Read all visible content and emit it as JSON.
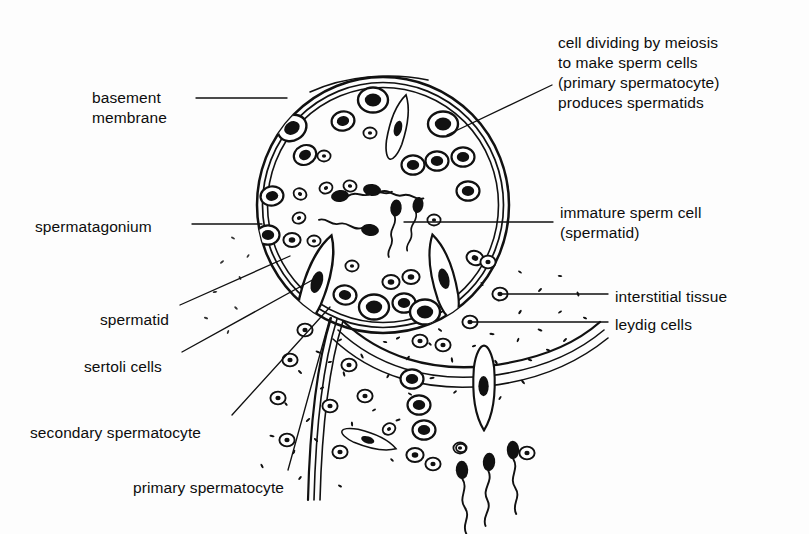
{
  "figure": {
    "background_color": "#fdfdfd",
    "ink_color": "#111111"
  },
  "labels": [
    {
      "id": "basement-membrane",
      "text": "basement\nmembrane",
      "x": 92,
      "y": 88,
      "align": "left"
    },
    {
      "id": "spermatagonium",
      "text": "spermatagonium",
      "x": 35,
      "y": 217,
      "align": "left"
    },
    {
      "id": "spermatid",
      "text": "spermatid",
      "x": 100,
      "y": 310,
      "align": "left"
    },
    {
      "id": "sertoli-cells",
      "text": "sertoli cells",
      "x": 84,
      "y": 357,
      "align": "left"
    },
    {
      "id": "secondary-spermatocyte",
      "text": "secondary spermatocyte",
      "x": 30,
      "y": 423,
      "align": "left"
    },
    {
      "id": "primary-spermatocyte",
      "text": "primary spermatocyte",
      "x": 133,
      "y": 478,
      "align": "left"
    },
    {
      "id": "meiosis-note",
      "text": "cell dividing by meiosis\nto make sperm cells\n(primary spermatocyte)\nproduces spermatids",
      "x": 558,
      "y": 33,
      "align": "left"
    },
    {
      "id": "immature-sperm-cell",
      "text": "immature sperm cell\n(spermatid)",
      "x": 560,
      "y": 203,
      "align": "left"
    },
    {
      "id": "interstitial-tissue",
      "text": "interstitial tissue",
      "x": 615,
      "y": 287,
      "align": "left"
    },
    {
      "id": "leydig-cells",
      "text": "leydig cells",
      "x": 615,
      "y": 315,
      "align": "left"
    }
  ],
  "leader_lines": [
    {
      "id": "leader-basement-membrane",
      "points": "196,98 287,98"
    },
    {
      "id": "leader-spermatagonium",
      "points": "192,224 262,224"
    },
    {
      "id": "leader-spermatid",
      "points": "180,305 290,256"
    },
    {
      "id": "leader-sertoli-cells",
      "points": "182,352 316,278"
    },
    {
      "id": "leader-secondary-spermatocyte",
      "points": "232,415 330,307"
    },
    {
      "id": "leader-primary-spermatocyte",
      "points": "288,470 330,318"
    },
    {
      "id": "leader-meiosis-note",
      "points": "552,85 447,135"
    },
    {
      "id": "leader-immature-sperm",
      "points": "553,222 404,222"
    },
    {
      "id": "leader-interstitial-tissue",
      "points": "608,294 500,294"
    },
    {
      "id": "leader-leydig-cells",
      "points": "608,322 470,322"
    }
  ],
  "structures": {
    "upper_tubule": {
      "name": "seminiferous tubule cross-section",
      "center": [
        383,
        205
      ],
      "radius": [
        128,
        128
      ],
      "wall_lines": 3
    },
    "lower_tubule": {
      "name": "second seminiferous tubule (lower)",
      "wall_lines": 3
    },
    "interstitial_tissue": {
      "name": "stippled interstitial connective tissue",
      "stipple": true
    }
  },
  "cell_types": {
    "spermatagonium": "oval cell with dark nucleus at tubule periphery",
    "primary_spermatocyte": "large oval cell with dark nucleus",
    "secondary_spermatocyte": "smaller oval cell",
    "spermatid": "small oval cell with small nucleus",
    "sertoli_cell": "elongated cone / teardrop shaped cell",
    "leydig_cell": "small round cell with dot nucleus in interstitium",
    "sperm": "dark oval head with long wavy tail"
  }
}
